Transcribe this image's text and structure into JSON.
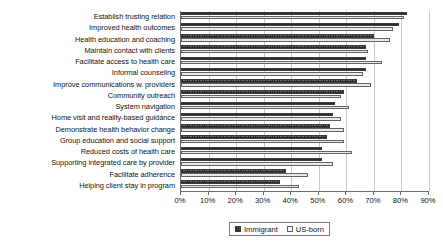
{
  "chart_data": {
    "type": "bar",
    "orientation": "horizontal",
    "title": "",
    "xlabel": "",
    "ylabel": "",
    "xlim": [
      0,
      90
    ],
    "xticks": [
      0,
      10,
      20,
      30,
      40,
      50,
      60,
      70,
      80,
      90
    ],
    "xtick_labels": [
      "0%",
      "10%",
      "20%",
      "30%",
      "40%",
      "50%",
      "60%",
      "70%",
      "80%",
      "90%"
    ],
    "grid": true,
    "legend_position": "bottom-center",
    "categories": [
      "Establish trusting relation",
      "Improved health outcomes",
      "Health education and coaching",
      "Maintain contact with clients",
      "Facilitate access to health care",
      "Informal counseling",
      "Improve communications w. providers",
      "Community outreach",
      "System navigation",
      "Home visit and reality-based guidance",
      "Demonstrate health behavior change",
      "Group education and social support",
      "Reduced costs of health care",
      "Supporting integrated care by provider",
      "Facilitate adherence",
      "Helping client stay in program"
    ],
    "series": [
      {
        "name": "Immigrant",
        "color": "#6e6e6e",
        "pattern": "checkered",
        "values": [
          82,
          79,
          70,
          67,
          67,
          67,
          64,
          59,
          56,
          55,
          54,
          53,
          51,
          51,
          38,
          36
        ]
      },
      {
        "name": "US-born",
        "color": "#e9e9e9",
        "pattern": "solid",
        "values": [
          81,
          77,
          76,
          68,
          73,
          66,
          69,
          58,
          61,
          58,
          59,
          59,
          62,
          55,
          46,
          43
        ]
      }
    ]
  },
  "legend": {
    "entries": [
      {
        "label": "Immigrant"
      },
      {
        "label": "US-born"
      }
    ]
  },
  "colors": {
    "axis": "#6b6b6b",
    "gridline": "#c9c9c9",
    "text": "#131313",
    "immigrant": "#6e6e6e",
    "usborn": "#e9e9e9"
  }
}
